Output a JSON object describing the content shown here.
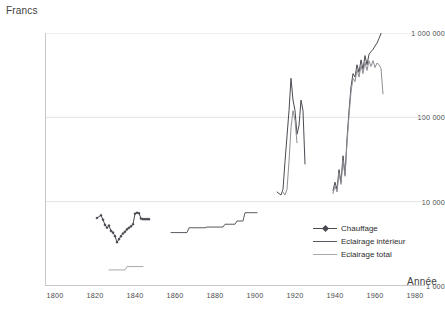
{
  "chart_data": {
    "type": "line",
    "title": "",
    "ylabel": "Francs",
    "xlabel": "Année",
    "yscale": "log",
    "ylim": [
      1000,
      1000000
    ],
    "xlim": [
      1795,
      1985
    ],
    "grid": "horizontal",
    "legend_position": "inside-bottom-right",
    "ytick_labels": [
      "1 000 000",
      "100 000",
      "10 000",
      "1 000"
    ],
    "ytick_values": [
      1000000,
      100000,
      10000,
      1000
    ],
    "xtick_labels": [
      "1800",
      "1820",
      "1840",
      "1860",
      "1880",
      "1900",
      "1920",
      "1940",
      "1960",
      "1980"
    ],
    "xtick_values": [
      1800,
      1820,
      1840,
      1860,
      1880,
      1900,
      1920,
      1940,
      1960,
      1980
    ],
    "colors": {
      "chauffage": "#4a4a52",
      "eclairage_interieur": "#5a5a62",
      "eclairage_total": "#a8a8ae",
      "grid": "#e2e2e2",
      "axis": "#c8c8c8"
    },
    "series": [
      {
        "name": "Chauffage",
        "color": "#4a4a52",
        "marker": "diamond",
        "points": [
          [
            1821,
            6400
          ],
          [
            1823,
            6900
          ],
          [
            1824,
            6100
          ],
          [
            1825,
            5300
          ],
          [
            1826,
            4900
          ],
          [
            1827,
            5200
          ],
          [
            1828,
            4500
          ],
          [
            1829,
            4300
          ],
          [
            1830,
            3900
          ],
          [
            1831,
            3300
          ],
          [
            1832,
            3600
          ],
          [
            1833,
            3900
          ],
          [
            1834,
            4200
          ],
          [
            1835,
            4400
          ],
          [
            1836,
            4700
          ],
          [
            1837,
            4900
          ],
          [
            1838,
            5100
          ],
          [
            1839,
            5400
          ],
          [
            1840,
            7200
          ],
          [
            1841,
            7400
          ],
          [
            1842,
            7300
          ],
          [
            1843,
            6300
          ],
          [
            1844,
            6200
          ],
          [
            1845,
            6200
          ],
          [
            1846,
            6200
          ],
          [
            1847,
            6200
          ]
        ]
      },
      {
        "name": "Eclairage intérieur",
        "color": "#5a5a62",
        "marker": "none",
        "points": [
          [
            1858,
            4300
          ],
          [
            1866,
            4300
          ],
          [
            1867,
            4900
          ],
          [
            1875,
            4900
          ],
          [
            1876,
            5000
          ],
          [
            1884,
            5000
          ],
          [
            1885,
            5400
          ],
          [
            1890,
            5400
          ],
          [
            1891,
            5900
          ],
          [
            1894,
            5900
          ],
          [
            1895,
            7400
          ],
          [
            1901,
            7400
          ]
        ]
      },
      {
        "name": "Eclairage total",
        "color": "#a8a8ae",
        "marker": "none",
        "points": [
          [
            1827,
            1550
          ],
          [
            1835,
            1550
          ],
          [
            1836,
            1700
          ],
          [
            1844,
            1700
          ]
        ]
      },
      {
        "name": "Chauffage (1910-1925)",
        "color": "#4a4a52",
        "marker": "none",
        "points": [
          [
            1911,
            13000
          ],
          [
            1913,
            12000
          ],
          [
            1914,
            14000
          ],
          [
            1915,
            30000
          ],
          [
            1916,
            60000
          ],
          [
            1917,
            120000
          ],
          [
            1918,
            290000
          ],
          [
            1919,
            160000
          ],
          [
            1920,
            120000
          ],
          [
            1921,
            63000
          ],
          [
            1922,
            80000
          ],
          [
            1923,
            160000
          ],
          [
            1924,
            120000
          ],
          [
            1925,
            28000
          ]
        ]
      },
      {
        "name": "Eclairage (1916-1921)",
        "color": "#8d8d94",
        "points": [
          [
            1914,
            13000
          ],
          [
            1915,
            12000
          ],
          [
            1916,
            14000
          ],
          [
            1917,
            30000
          ],
          [
            1918,
            75000
          ],
          [
            1919,
            120000
          ],
          [
            1920,
            92000
          ],
          [
            1921,
            50000
          ]
        ]
      },
      {
        "name": "Chauffage (1939-1965)",
        "color": "#4a4a52",
        "points": [
          [
            1939,
            13500
          ],
          [
            1940,
            17000
          ],
          [
            1941,
            14000
          ],
          [
            1942,
            24000
          ],
          [
            1943,
            17000
          ],
          [
            1944,
            35000
          ],
          [
            1945,
            21000
          ],
          [
            1946,
            55000
          ],
          [
            1947,
            120000
          ],
          [
            1948,
            230000
          ],
          [
            1949,
            330000
          ],
          [
            1950,
            300000
          ],
          [
            1951,
            420000
          ],
          [
            1952,
            340000
          ],
          [
            1953,
            480000
          ],
          [
            1954,
            370000
          ],
          [
            1955,
            540000
          ],
          [
            1956,
            420000
          ],
          [
            1957,
            560000
          ],
          [
            1958,
            600000
          ],
          [
            1959,
            640000
          ],
          [
            1960,
            700000
          ],
          [
            1961,
            760000
          ],
          [
            1962,
            860000
          ],
          [
            1963,
            990000
          ]
        ]
      },
      {
        "name": "Eclairage (1939-1964)",
        "color": "#8d8d94",
        "points": [
          [
            1939,
            12500
          ],
          [
            1940,
            15500
          ],
          [
            1941,
            13000
          ],
          [
            1942,
            22000
          ],
          [
            1943,
            16000
          ],
          [
            1944,
            31000
          ],
          [
            1945,
            20000
          ],
          [
            1946,
            50000
          ],
          [
            1947,
            105000
          ],
          [
            1948,
            200000
          ],
          [
            1949,
            290000
          ],
          [
            1950,
            265000
          ],
          [
            1951,
            370000
          ],
          [
            1952,
            300000
          ],
          [
            1953,
            410000
          ],
          [
            1954,
            330000
          ],
          [
            1955,
            450000
          ],
          [
            1956,
            360000
          ],
          [
            1957,
            470000
          ],
          [
            1958,
            400000
          ],
          [
            1959,
            470000
          ],
          [
            1960,
            390000
          ],
          [
            1961,
            440000
          ],
          [
            1962,
            420000
          ],
          [
            1963,
            380000
          ],
          [
            1964,
            190000
          ]
        ]
      }
    ],
    "legend": [
      {
        "label": "Chauffage",
        "color": "#4a4a52",
        "marker": true
      },
      {
        "label": "Eclairage intérieur",
        "color": "#5a5a62",
        "marker": false
      },
      {
        "label": "Eclairage total",
        "color": "#a8a8ae",
        "marker": false
      }
    ]
  }
}
